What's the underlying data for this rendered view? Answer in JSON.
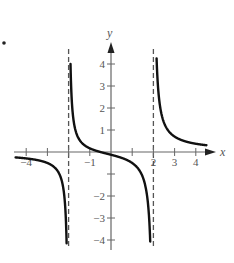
{
  "chart_data": {
    "type": "line",
    "title": "",
    "xlabel": "x",
    "ylabel": "y",
    "xlim": [
      -4.6,
      4.6
    ],
    "ylim": [
      -4.5,
      4.5
    ],
    "grid": false,
    "legend": null,
    "x_ticks": [
      -4,
      -3,
      -2,
      -1,
      1,
      2,
      3,
      4
    ],
    "x_tick_labels": [
      {
        "value": -4,
        "label": "−4"
      },
      {
        "value": -1,
        "label": "−1"
      },
      {
        "value": 2,
        "label": "2"
      },
      {
        "value": 3,
        "label": "3"
      },
      {
        "value": 4,
        "label": "4"
      }
    ],
    "y_ticks": [
      -4,
      -3,
      -2,
      -1,
      1,
      2,
      3,
      4
    ],
    "y_tick_labels": [
      {
        "value": 4,
        "label": "4"
      },
      {
        "value": 3,
        "label": "3"
      },
      {
        "value": 2,
        "label": "2"
      },
      {
        "value": 1,
        "label": "1"
      },
      {
        "value": -2,
        "label": "−2"
      },
      {
        "value": -3,
        "label": "−3"
      },
      {
        "value": -4,
        "label": "−4"
      }
    ],
    "vertical_asymptotes": [
      -2,
      2
    ],
    "horizontal_asymptote": 0,
    "series": [
      {
        "name": "left-branch",
        "x": [
          -4.5,
          -4.0,
          -3.5,
          -3.0,
          -2.5,
          -2.3,
          -2.2,
          -2.12
        ],
        "y": [
          -0.25,
          -0.29,
          -0.36,
          -0.5,
          -0.89,
          -1.39,
          -2.02,
          -3.0
        ]
      },
      {
        "name": "middle-branch",
        "x": [
          -1.87,
          -1.8,
          -1.5,
          -1.0,
          -0.5,
          0.0,
          0.5,
          1.0,
          1.5,
          1.8,
          1.9
        ],
        "y": [
          2.5,
          1.9,
          1.14,
          0.17,
          0.0,
          -0.125,
          -0.27,
          -0.5,
          -1.14,
          -3.37,
          -6.2
        ]
      },
      {
        "name": "right-branch",
        "x": [
          2.12,
          2.2,
          2.5,
          3.0,
          3.5,
          4.0,
          4.5
        ],
        "y": [
          5.3,
          3.23,
          1.33,
          0.7,
          0.48,
          0.375,
          0.31
        ]
      }
    ],
    "function_hint": "y = (x + 0.5) / (x^2 - 4)",
    "marker": {
      "x_px": 2,
      "y_px": 43,
      "label": "•"
    }
  },
  "labels": {
    "x_axis": "x",
    "y_axis": "y",
    "bullet": "•"
  }
}
